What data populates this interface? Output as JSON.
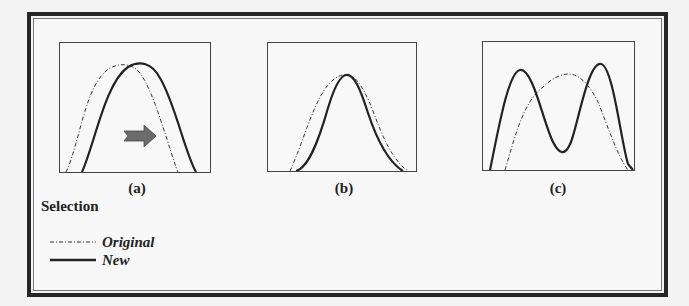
{
  "figure": {
    "panels": [
      {
        "id": "a",
        "caption": "(a)",
        "description": "New curve shifted right relative to Original",
        "has_arrow": true,
        "arrow_color": "#6b6b6b"
      },
      {
        "id": "b",
        "caption": "(b)",
        "description": "New curve narrower than Original, same peak"
      },
      {
        "id": "c",
        "caption": "(c)",
        "description": "New curve bimodal, Original unimodal"
      }
    ],
    "legend": {
      "title": "Selection",
      "items": [
        {
          "label": "Original",
          "style": "dash-dot"
        },
        {
          "label": "New",
          "style": "solid"
        }
      ]
    },
    "colors": {
      "line": "#222222",
      "frame": "#262626",
      "background": "#f7f7f7"
    }
  }
}
